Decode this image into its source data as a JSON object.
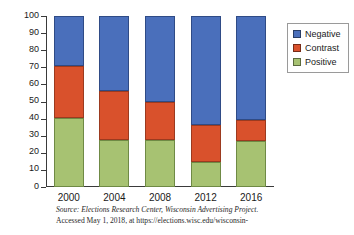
{
  "chart_data": {
    "type": "bar",
    "subtype": "stacked-percentage",
    "title": "",
    "xlabel": "",
    "ylabel": "Percentage",
    "categories": [
      "2000",
      "2004",
      "2008",
      "2012",
      "2016"
    ],
    "series": [
      {
        "name": "Positive",
        "color": "#a7c272",
        "values": [
          40.5,
          27.5,
          27.5,
          14.5,
          27.0
        ]
      },
      {
        "name": "Contrast",
        "color": "#d9512c",
        "values": [
          30.0,
          28.5,
          22.5,
          21.5,
          12.0
        ]
      },
      {
        "name": "Negative",
        "color": "#4a6fbb",
        "values": [
          29.5,
          44.0,
          50.0,
          64.0,
          61.0
        ]
      }
    ],
    "stack_order_bottom_to_top": [
      "Positive",
      "Contrast",
      "Negative"
    ],
    "ylim": [
      0,
      100
    ],
    "yticks": [
      0,
      10,
      20,
      30,
      40,
      50,
      60,
      70,
      80,
      90,
      100
    ],
    "ytick_labels": [
      "0",
      "10",
      "20",
      "30",
      "40",
      "50",
      "60",
      "70",
      "80",
      "90",
      "100"
    ],
    "grid": false,
    "legend_position": "right",
    "legend_entries": [
      "Negative",
      "Contrast",
      "Positive"
    ]
  },
  "axes": {
    "y_label": "Percentage",
    "y_ticks": [
      "100",
      "90",
      "80",
      "70",
      "60",
      "50",
      "40",
      "30",
      "20",
      "10",
      "0"
    ],
    "x_ticks": [
      "2000",
      "2004",
      "2008",
      "2012",
      "2016"
    ]
  },
  "legend": {
    "items": [
      {
        "label": "Negative",
        "color": "#4a6fbb"
      },
      {
        "label": "Contrast",
        "color": "#d9512c"
      },
      {
        "label": "Positive",
        "color": "#a7c272"
      }
    ]
  },
  "source": {
    "line1": "Source: Elections Research Center, Wisconsin Advertising Project.",
    "line2": "Accessed May 1, 2018, at https://elections.wisc.edu/wisconsin-"
  }
}
